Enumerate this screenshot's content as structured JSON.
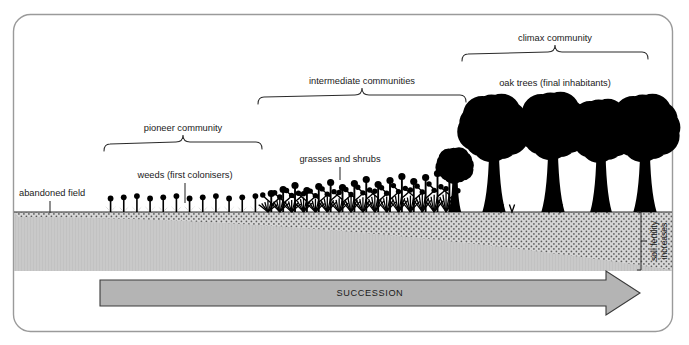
{
  "figure": {
    "type": "diagram",
    "frame_color": "#9a9a9a",
    "background": "#ffffff",
    "vegetation_color": "#000000",
    "subsoil_color": "#c9c9c9",
    "topsoil_color": "#d6d6d6",
    "arrow_fill": "#b4b4b4",
    "arrow_stroke": "#3a3a3a"
  },
  "brackets": [
    {
      "id": "pioneer",
      "label": "pioneer community",
      "x_start": 104,
      "x_end": 262,
      "label_x": 183,
      "label_y": 131,
      "bracket_y": 142
    },
    {
      "id": "intermediate",
      "label": "intermediate communities",
      "x_start": 258,
      "x_end": 466,
      "label_x": 362,
      "label_y": 84,
      "bracket_y": 95
    },
    {
      "id": "climax",
      "label": "climax community",
      "x_start": 462,
      "x_end": 648,
      "label_x": 555,
      "label_y": 41,
      "bracket_y": 52
    }
  ],
  "callouts": [
    {
      "id": "abandoned-field",
      "label": "abandoned field",
      "label_x": 19,
      "label_y": 196,
      "anchor": "start",
      "leader_x": 50,
      "leader_y1": 201,
      "leader_y2": 213
    },
    {
      "id": "weeds",
      "label": "weeds (first colonisers)",
      "label_x": 185,
      "label_y": 178,
      "anchor": "middle",
      "leader_x": 185,
      "leader_y1": 183,
      "leader_y2": 203
    },
    {
      "id": "grasses-shrubs",
      "label": "grasses and shrubs",
      "label_x": 340,
      "label_y": 162,
      "anchor": "middle",
      "leader_x": 340,
      "leader_y1": 167,
      "leader_y2": 180
    },
    {
      "id": "oak-trees",
      "label": "oak trees (final inhabitants)",
      "label_x": 555,
      "label_y": 86,
      "anchor": "middle",
      "leader_x": 0,
      "leader_y1": 0,
      "leader_y2": 0
    }
  ],
  "soil": {
    "label_line_1": "soil fertility",
    "label_line_2": "increases",
    "ground_y": 212,
    "subsoil_bottom": 271,
    "topsoil_left_depth": 5,
    "topsoil_right_depth": 58,
    "measure_bracket_x": 641
  },
  "succession_arrow": {
    "label": "SUCCESSION",
    "x_start": 100,
    "x_end": 640,
    "y_center": 293,
    "label_x": 370,
    "label_y": 296
  },
  "vegetation": {
    "weeds_zone": {
      "x_start": 104,
      "x_end": 262,
      "count": 12,
      "height": 12
    },
    "grass_zone": {
      "x_start": 262,
      "x_end": 452,
      "count": 16,
      "height": 30
    },
    "sapling_zone": {
      "x_start": 440,
      "x_end": 470,
      "count": 1,
      "height": 62
    },
    "trees": [
      {
        "x": 494,
        "canopy_r": 30,
        "trunk_h": 72,
        "top_y": 108
      },
      {
        "x": 553,
        "canopy_r": 30,
        "trunk_h": 74,
        "top_y": 105
      },
      {
        "x": 601,
        "canopy_r": 28,
        "trunk_h": 70,
        "top_y": 112
      },
      {
        "x": 645,
        "canopy_r": 30,
        "trunk_h": 72,
        "top_y": 106
      }
    ]
  }
}
